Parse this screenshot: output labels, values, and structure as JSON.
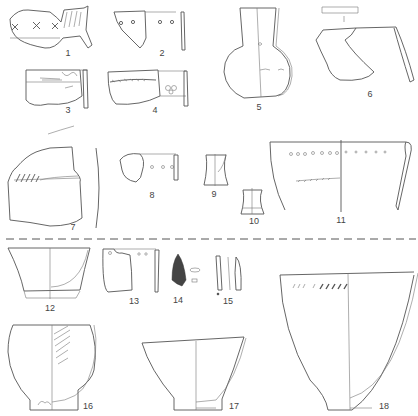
{
  "figure": {
    "divider": "dashed",
    "items": [
      {
        "num": "1",
        "x": 68,
        "y": 53
      },
      {
        "num": "2",
        "x": 162,
        "y": 53
      },
      {
        "num": "3",
        "x": 68,
        "y": 110
      },
      {
        "num": "4",
        "x": 155,
        "y": 110
      },
      {
        "num": "5",
        "x": 259,
        "y": 107
      },
      {
        "num": "6",
        "x": 370,
        "y": 94
      },
      {
        "num": "7",
        "x": 73,
        "y": 227
      },
      {
        "num": "8",
        "x": 152,
        "y": 195
      },
      {
        "num": "9",
        "x": 214,
        "y": 194
      },
      {
        "num": "10",
        "x": 254,
        "y": 221
      },
      {
        "num": "11",
        "x": 341,
        "y": 220
      },
      {
        "num": "12",
        "x": 50,
        "y": 308
      },
      {
        "num": "13",
        "x": 134,
        "y": 301
      },
      {
        "num": "14",
        "x": 178,
        "y": 300
      },
      {
        "num": "15",
        "x": 228,
        "y": 301
      },
      {
        "num": "16",
        "x": 82,
        "y": 406
      },
      {
        "num": "17",
        "x": 234,
        "y": 406
      },
      {
        "num": "18",
        "x": 384,
        "y": 406
      }
    ]
  }
}
